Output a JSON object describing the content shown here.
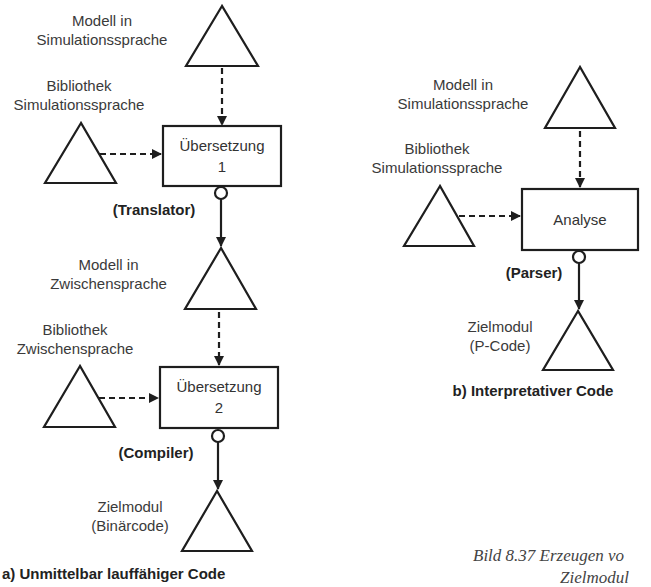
{
  "diagram": {
    "title": "Bild 8.37 Erzeugen vo",
    "caption_line2": "Zielmodul",
    "left": {
      "heading": "a) Unmittelbar lauffähiger Code",
      "model_sim": [
        "Modell in",
        "Simulationssprache"
      ],
      "lib_sim": [
        "Bibliothek",
        "Simulationssprache"
      ],
      "box1": [
        "Übersetzung",
        "1"
      ],
      "tool1": "(Translator)",
      "model_inter": [
        "Modell in",
        "Zwischensprache"
      ],
      "lib_inter": [
        "Bibliothek",
        "Zwischensprache"
      ],
      "box2": [
        "Übersetzung",
        "2"
      ],
      "tool2": "(Compiler)",
      "target": [
        "Zielmodul",
        "(Binärcode)"
      ]
    },
    "right": {
      "heading": "b) Interpretativer Code",
      "model_sim": [
        "Modell in",
        "Simulationssprache"
      ],
      "lib_sim": [
        "Bibliothek",
        "Simulationssprache"
      ],
      "box": "Analyse",
      "tool": "(Parser)",
      "target": [
        "Zielmodul",
        "(P-Code)"
      ]
    },
    "colors": {
      "stroke": "#1e1e1e",
      "text": "#3a3a3a",
      "background": "#ffffff"
    }
  }
}
